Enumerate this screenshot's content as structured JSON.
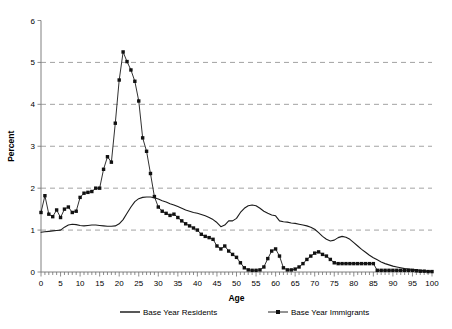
{
  "chart_data": {
    "type": "line",
    "title": "",
    "xlabel": "Age",
    "ylabel": "Percent",
    "xlim": [
      0,
      100
    ],
    "ylim": [
      0,
      6
    ],
    "xticks": [
      0,
      5,
      10,
      15,
      20,
      25,
      30,
      35,
      40,
      45,
      50,
      55,
      60,
      65,
      70,
      75,
      80,
      85,
      90,
      95,
      100
    ],
    "yticks": [
      0,
      1,
      2,
      3,
      4,
      5,
      6
    ],
    "xtick_labels": [
      "0",
      "5",
      "10",
      "15",
      "20",
      "25",
      "30",
      "35",
      "40",
      "45",
      "50",
      "55",
      "60",
      "65",
      "70",
      "75",
      "80",
      "85",
      "90",
      "95",
      "100"
    ],
    "ytick_labels": [
      "0",
      "1",
      "2",
      "3",
      "4",
      "5",
      "6"
    ],
    "grid": "horizontal-dashed",
    "legend_position": "below-axis",
    "x": [
      0,
      1,
      2,
      3,
      4,
      5,
      6,
      7,
      8,
      9,
      10,
      11,
      12,
      13,
      14,
      15,
      16,
      17,
      18,
      19,
      20,
      21,
      22,
      23,
      24,
      25,
      26,
      27,
      28,
      29,
      30,
      31,
      32,
      33,
      34,
      35,
      36,
      37,
      38,
      39,
      40,
      41,
      42,
      43,
      44,
      45,
      46,
      47,
      48,
      49,
      50,
      51,
      52,
      53,
      54,
      55,
      56,
      57,
      58,
      59,
      60,
      61,
      62,
      63,
      64,
      65,
      66,
      67,
      68,
      69,
      70,
      71,
      72,
      73,
      74,
      75,
      76,
      77,
      78,
      79,
      80,
      81,
      82,
      83,
      84,
      85,
      86,
      87,
      88,
      89,
      90,
      91,
      92,
      93,
      94,
      95,
      96,
      97,
      98,
      99,
      100
    ],
    "series": [
      {
        "name": "Base Year Residents",
        "marker": "none",
        "values": [
          0.95,
          0.96,
          0.97,
          0.98,
          0.99,
          1.0,
          1.07,
          1.12,
          1.14,
          1.13,
          1.11,
          1.1,
          1.11,
          1.12,
          1.12,
          1.11,
          1.1,
          1.09,
          1.09,
          1.1,
          1.15,
          1.25,
          1.4,
          1.55,
          1.68,
          1.75,
          1.78,
          1.79,
          1.79,
          1.77,
          1.74,
          1.7,
          1.67,
          1.63,
          1.6,
          1.56,
          1.52,
          1.48,
          1.45,
          1.42,
          1.4,
          1.37,
          1.34,
          1.3,
          1.25,
          1.18,
          1.08,
          1.12,
          1.22,
          1.22,
          1.28,
          1.42,
          1.52,
          1.58,
          1.6,
          1.58,
          1.52,
          1.45,
          1.4,
          1.36,
          1.34,
          1.22,
          1.2,
          1.19,
          1.17,
          1.16,
          1.14,
          1.12,
          1.1,
          1.07,
          1.02,
          0.94,
          0.85,
          0.78,
          0.74,
          0.76,
          0.82,
          0.85,
          0.83,
          0.78,
          0.7,
          0.62,
          0.54,
          0.47,
          0.4,
          0.34,
          0.29,
          0.24,
          0.2,
          0.17,
          0.14,
          0.12,
          0.1,
          0.08,
          0.07,
          0.06,
          0.05,
          0.04,
          0.03,
          0.02,
          0.02
        ]
      },
      {
        "name": "Base Year Immigrants",
        "marker": "square",
        "values": [
          1.42,
          1.82,
          1.38,
          1.32,
          1.48,
          1.3,
          1.5,
          1.55,
          1.42,
          1.45,
          1.78,
          1.88,
          1.9,
          1.92,
          2.0,
          2.0,
          2.45,
          2.75,
          2.62,
          3.55,
          4.58,
          5.25,
          5.02,
          4.82,
          4.55,
          4.08,
          3.2,
          2.88,
          2.35,
          1.8,
          1.55,
          1.45,
          1.4,
          1.35,
          1.38,
          1.3,
          1.22,
          1.15,
          1.1,
          1.05,
          1.0,
          0.9,
          0.85,
          0.82,
          0.78,
          0.62,
          0.55,
          0.62,
          0.5,
          0.42,
          0.35,
          0.22,
          0.1,
          0.05,
          0.04,
          0.04,
          0.05,
          0.12,
          0.32,
          0.5,
          0.55,
          0.38,
          0.1,
          0.05,
          0.05,
          0.07,
          0.12,
          0.2,
          0.3,
          0.38,
          0.45,
          0.48,
          0.42,
          0.38,
          0.3,
          0.22,
          0.2,
          0.2,
          0.2,
          0.2,
          0.2,
          0.2,
          0.2,
          0.2,
          0.2,
          0.2,
          0.04,
          0.04,
          0.04,
          0.04,
          0.04,
          0.04,
          0.04,
          0.04,
          0.04,
          0.04,
          0.03,
          0.02,
          0.02,
          0.01,
          0.01
        ]
      }
    ],
    "legend": [
      {
        "label": "Base Year Residents",
        "marker": "none"
      },
      {
        "label": "Base Year Immigrants",
        "marker": "square"
      }
    ]
  }
}
